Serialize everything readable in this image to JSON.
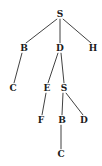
{
  "figure": {
    "type": "tree-diagram",
    "background_color": "#ffffff",
    "edge_color": "#2b2b2b",
    "label_color": "#1b1b1b"
  },
  "chart_data": {
    "type": "diagram",
    "title": "",
    "nodes": [
      {
        "id": "n0",
        "label": "S",
        "x": 60,
        "y": 14,
        "depth": 0
      },
      {
        "id": "n1",
        "label": "B",
        "x": 24,
        "y": 48,
        "depth": 1
      },
      {
        "id": "n2",
        "label": "D",
        "x": 60,
        "y": 48,
        "depth": 1
      },
      {
        "id": "n3",
        "label": "H",
        "x": 93,
        "y": 48,
        "depth": 1
      },
      {
        "id": "n4",
        "label": "C",
        "x": 13,
        "y": 88,
        "depth": 2
      },
      {
        "id": "n5",
        "label": "E",
        "x": 47,
        "y": 88,
        "depth": 2
      },
      {
        "id": "n6",
        "label": "S",
        "x": 64,
        "y": 88,
        "depth": 2
      },
      {
        "id": "n7",
        "label": "F",
        "x": 41,
        "y": 120,
        "depth": 3
      },
      {
        "id": "n8",
        "label": "B",
        "x": 62,
        "y": 120,
        "depth": 3
      },
      {
        "id": "n9",
        "label": "D",
        "x": 84,
        "y": 120,
        "depth": 3
      },
      {
        "id": "n10",
        "label": "C",
        "x": 61,
        "y": 154,
        "depth": 4
      }
    ],
    "edges": [
      {
        "from": "n0",
        "to": "n1",
        "x1": 57,
        "y1": 19,
        "x2": 26,
        "y2": 43
      },
      {
        "from": "n0",
        "to": "n2",
        "x1": 60,
        "y1": 19,
        "x2": 60,
        "y2": 43
      },
      {
        "from": "n0",
        "to": "n3",
        "x1": 63,
        "y1": 19,
        "x2": 91,
        "y2": 43
      },
      {
        "from": "n1",
        "to": "n4",
        "x1": 22,
        "y1": 53,
        "x2": 14,
        "y2": 83
      },
      {
        "from": "n2",
        "to": "n5",
        "x1": 58,
        "y1": 53,
        "x2": 48,
        "y2": 83
      },
      {
        "from": "n2",
        "to": "n6",
        "x1": 61,
        "y1": 53,
        "x2": 64,
        "y2": 83
      },
      {
        "from": "n5",
        "to": "n7",
        "x1": 46,
        "y1": 93,
        "x2": 42,
        "y2": 115
      },
      {
        "from": "n6",
        "to": "n8",
        "x1": 63,
        "y1": 93,
        "x2": 62,
        "y2": 115
      },
      {
        "from": "n6",
        "to": "n9",
        "x1": 66,
        "y1": 93,
        "x2": 83,
        "y2": 115
      },
      {
        "from": "n8",
        "to": "n10",
        "x1": 61,
        "y1": 125,
        "x2": 61,
        "y2": 149
      }
    ]
  }
}
